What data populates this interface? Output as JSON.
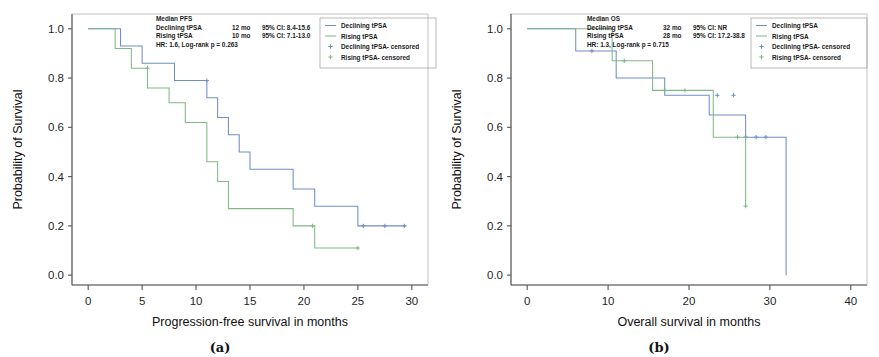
{
  "figure": {
    "panels": [
      {
        "caption": "(a)",
        "name": "panel-a",
        "axes": {
          "ylabel": "Probability of Survival",
          "xlabel": "Progression-free survival in months",
          "yticks": [
            "0.0",
            "0.2",
            "0.4",
            "0.6",
            "0.8",
            "1.0"
          ],
          "ytick_values": [
            0.0,
            0.2,
            0.4,
            0.6,
            0.8,
            1.0
          ],
          "xticks": [
            "0",
            "5",
            "10",
            "15",
            "20",
            "25",
            "30"
          ],
          "xtick_values": [
            0,
            5,
            10,
            15,
            20,
            25,
            30
          ],
          "xlim": [
            -1.5,
            31.5
          ],
          "ylim": [
            -0.04,
            1.06
          ]
        },
        "annotation": {
          "title": "Median PFS",
          "rows": [
            {
              "label": "Declining tPSA",
              "median": "12 mo",
              "ci": "95% CI: 8.4-15.6"
            },
            {
              "label": "Rising tPSA",
              "median": "10 mo",
              "ci": "95% CI: 7.1-13.0"
            }
          ],
          "stats": "HR: 1.6, Log-rank p = 0.263"
        },
        "legend": [
          {
            "label": "Declining tPSA",
            "marker": "line",
            "color": "#6f8ec6"
          },
          {
            "label": "Rising tPSA",
            "marker": "line",
            "color": "#7fba84"
          },
          {
            "label": "Declining tPSA- censored",
            "marker": "plus",
            "color": "#6f8ec6"
          },
          {
            "label": "Rising tPSA- censored",
            "marker": "plus",
            "color": "#7fba84"
          }
        ]
      },
      {
        "caption": "(b)",
        "name": "panel-b",
        "axes": {
          "ylabel": "Probability of Survival",
          "xlabel": "Overall survival in months",
          "yticks": [
            "0.0",
            "0.2",
            "0.4",
            "0.6",
            "0.8",
            "1.0"
          ],
          "ytick_values": [
            0.0,
            0.2,
            0.4,
            0.6,
            0.8,
            1.0
          ],
          "xticks": [
            "0",
            "10",
            "20",
            "30",
            "40"
          ],
          "xtick_values": [
            0,
            10,
            20,
            30,
            40
          ],
          "xlim": [
            -2,
            42
          ],
          "ylim": [
            -0.04,
            1.06
          ]
        },
        "annotation": {
          "title": "Median OS",
          "rows": [
            {
              "label": "Declining tPSA",
              "median": "32 mo",
              "ci": "95% CI: NR"
            },
            {
              "label": "Rising tPSA",
              "median": "28 mo",
              "ci": "95% CI: 17.2-38.8"
            }
          ],
          "stats": "HR: 1.3, Log-rank p = 0.715"
        },
        "legend": [
          {
            "label": "Declining tPSA",
            "marker": "line",
            "color": "#6f8ec6"
          },
          {
            "label": "Rising tPSA",
            "marker": "line",
            "color": "#7fba84"
          },
          {
            "label": "Declining tPSA- censored",
            "marker": "plus",
            "color": "#6f8ec6"
          },
          {
            "label": "Rising tPSA- censored",
            "marker": "plus",
            "color": "#7fba84"
          }
        ]
      }
    ]
  },
  "chart_data": [
    {
      "type": "line",
      "subtype": "kaplan-meier-step",
      "panel": "(a)",
      "title": "Median PFS",
      "xlabel": "Progression-free survival in months",
      "ylabel": "Probability of Survival",
      "xlim": [
        -1.5,
        31.5
      ],
      "ylim": [
        -0.04,
        1.06
      ],
      "xticks": [
        0,
        5,
        10,
        15,
        20,
        25,
        30
      ],
      "yticks": [
        0.0,
        0.2,
        0.4,
        0.6,
        0.8,
        1.0
      ],
      "grid": false,
      "legend_position": "top-right-outside",
      "annotations": [
        "Median PFS",
        "Declining tPSA  12 mo  95% CI: 8.4-15.6",
        "Rising tPSA  10 mo  95% CI: 7.1-13.0",
        "HR: 1.6, Log-rank p = 0.263"
      ],
      "series": [
        {
          "name": "Declining tPSA",
          "color": "#6f8ec6",
          "points": [
            [
              0,
              1.0
            ],
            [
              3.0,
              1.0
            ],
            [
              3.0,
              0.93
            ],
            [
              5.0,
              0.93
            ],
            [
              5.0,
              0.86
            ],
            [
              8.0,
              0.86
            ],
            [
              8.0,
              0.79
            ],
            [
              11.0,
              0.79
            ],
            [
              11.0,
              0.72
            ],
            [
              12.0,
              0.72
            ],
            [
              12.0,
              0.64
            ],
            [
              13.0,
              0.64
            ],
            [
              13.0,
              0.57
            ],
            [
              14.0,
              0.57
            ],
            [
              14.0,
              0.5
            ],
            [
              15.0,
              0.5
            ],
            [
              15.0,
              0.43
            ],
            [
              19.0,
              0.43
            ],
            [
              19.0,
              0.35
            ],
            [
              21.0,
              0.35
            ],
            [
              21.0,
              0.28
            ],
            [
              25.0,
              0.28
            ],
            [
              25.0,
              0.2
            ],
            [
              29.5,
              0.2
            ]
          ],
          "censored": [
            [
              11.0,
              0.79
            ],
            [
              25.5,
              0.2
            ],
            [
              27.5,
              0.2
            ],
            [
              29.3,
              0.2
            ]
          ]
        },
        {
          "name": "Rising tPSA",
          "color": "#7fba84",
          "points": [
            [
              0,
              1.0
            ],
            [
              2.5,
              1.0
            ],
            [
              2.5,
              0.92
            ],
            [
              4.0,
              0.92
            ],
            [
              4.0,
              0.84
            ],
            [
              5.5,
              0.84
            ],
            [
              5.5,
              0.76
            ],
            [
              7.5,
              0.76
            ],
            [
              7.5,
              0.7
            ],
            [
              9.0,
              0.7
            ],
            [
              9.0,
              0.62
            ],
            [
              11.0,
              0.62
            ],
            [
              11.0,
              0.46
            ],
            [
              12.0,
              0.46
            ],
            [
              12.0,
              0.38
            ],
            [
              13.0,
              0.38
            ],
            [
              13.0,
              0.27
            ],
            [
              19.0,
              0.27
            ],
            [
              19.0,
              0.2
            ],
            [
              21.0,
              0.2
            ],
            [
              21.0,
              0.11
            ],
            [
              25.0,
              0.11
            ]
          ],
          "censored": [
            [
              5.5,
              0.84
            ],
            [
              20.8,
              0.2
            ],
            [
              25.0,
              0.11
            ]
          ]
        }
      ]
    },
    {
      "type": "line",
      "subtype": "kaplan-meier-step",
      "panel": "(b)",
      "title": "Median OS",
      "xlabel": "Overall survival in months",
      "ylabel": "Probability of Survival",
      "xlim": [
        -2,
        42
      ],
      "ylim": [
        -0.04,
        1.06
      ],
      "xticks": [
        0,
        10,
        20,
        30,
        40
      ],
      "yticks": [
        0.0,
        0.2,
        0.4,
        0.6,
        0.8,
        1.0
      ],
      "grid": false,
      "legend_position": "top-right-outside",
      "annotations": [
        "Median OS",
        "Declining tPSA  32 mo  95% CI: NR",
        "Rising tPSA  28 mo  95% CI: 17.2-38.8",
        "HR: 1.3, Log-rank p = 0.715"
      ],
      "series": [
        {
          "name": "Declining tPSA",
          "color": "#6f8ec6",
          "points": [
            [
              0,
              1.0
            ],
            [
              6.0,
              1.0
            ],
            [
              6.0,
              0.91
            ],
            [
              11.0,
              0.91
            ],
            [
              11.0,
              0.8
            ],
            [
              17.0,
              0.8
            ],
            [
              17.0,
              0.73
            ],
            [
              22.5,
              0.73
            ],
            [
              22.5,
              0.65
            ],
            [
              27.0,
              0.65
            ],
            [
              27.0,
              0.56
            ],
            [
              32.0,
              0.56
            ],
            [
              32.0,
              0.0
            ]
          ],
          "censored": [
            [
              8.0,
              0.91
            ],
            [
              23.5,
              0.73
            ],
            [
              25.5,
              0.73
            ],
            [
              27.0,
              0.56
            ],
            [
              28.3,
              0.56
            ],
            [
              29.5,
              0.56
            ]
          ]
        },
        {
          "name": "Rising tPSA",
          "color": "#7fba84",
          "points": [
            [
              0,
              1.0
            ],
            [
              10.5,
              1.0
            ],
            [
              10.5,
              0.87
            ],
            [
              15.5,
              0.87
            ],
            [
              15.5,
              0.75
            ],
            [
              23.0,
              0.75
            ],
            [
              23.0,
              0.56
            ],
            [
              27.0,
              0.56
            ],
            [
              27.0,
              0.28
            ]
          ],
          "censored": [
            [
              12.0,
              0.87
            ],
            [
              17.0,
              0.75
            ],
            [
              19.5,
              0.75
            ],
            [
              26.0,
              0.56
            ],
            [
              27.0,
              0.28
            ]
          ]
        }
      ]
    }
  ]
}
